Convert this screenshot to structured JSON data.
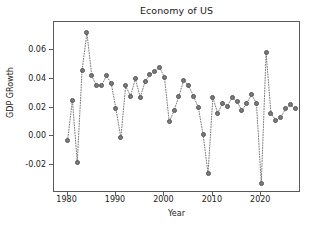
{
  "chart_data": {
    "type": "line",
    "title": "Economy of US",
    "xlabel": "Year",
    "ylabel": "GDP GRowth",
    "xlim": [
      1977.2,
      2028.2
    ],
    "ylim": [
      -0.0395,
      0.0795
    ],
    "grid": false,
    "legend": null,
    "linestyle": "dotted",
    "marker": "circle",
    "color": "#7b7b7b",
    "xticks": [
      1980,
      1990,
      2000,
      2010,
      2020
    ],
    "xtick_labels": [
      "1980",
      "1990",
      "2000",
      "2010",
      "2020"
    ],
    "yticks": [
      -0.02,
      0.0,
      0.02,
      0.04,
      0.06
    ],
    "ytick_labels": [
      "-0.02",
      "0.00",
      "0.02",
      "0.04",
      "0.06"
    ],
    "x": [
      1980,
      1981,
      1982,
      1983,
      1984,
      1985,
      1986,
      1987,
      1988,
      1989,
      1990,
      1991,
      1992,
      1993,
      1994,
      1995,
      1996,
      1997,
      1998,
      1999,
      2000,
      2001,
      2002,
      2003,
      2004,
      2005,
      2006,
      2007,
      2008,
      2009,
      2010,
      2011,
      2012,
      2013,
      2014,
      2015,
      2016,
      2017,
      2018,
      2019,
      2020,
      2021,
      2022,
      2023,
      2024,
      2025,
      2026,
      2027
    ],
    "values": [
      -0.003,
      0.025,
      -0.018,
      0.046,
      0.072,
      0.042,
      0.035,
      0.035,
      0.042,
      0.037,
      0.019,
      -0.001,
      0.035,
      0.028,
      0.04,
      0.027,
      0.038,
      0.043,
      0.045,
      0.048,
      0.041,
      0.01,
      0.018,
      0.028,
      0.039,
      0.035,
      0.028,
      0.02,
      0.001,
      -0.026,
      0.027,
      0.016,
      0.023,
      0.021,
      0.027,
      0.024,
      0.018,
      0.023,
      0.029,
      0.023,
      -0.033,
      0.058,
      0.016,
      0.011,
      0.013,
      0.019,
      0.022,
      0.019
    ]
  }
}
